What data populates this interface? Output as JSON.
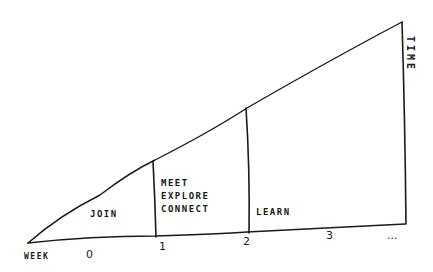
{
  "diagram": {
    "axis_x_label": "WEEK",
    "axis_y_label": "TIME",
    "ticks": [
      "0",
      "1",
      "2",
      "3",
      "..."
    ],
    "phases": [
      {
        "label": "JOIN"
      },
      {
        "label_lines": [
          "MEET",
          "EXPLORE",
          "CONNECT"
        ]
      },
      {
        "label": "LEARN"
      }
    ],
    "stroke_color": "#1a1a1a",
    "background": "#ffffff"
  }
}
